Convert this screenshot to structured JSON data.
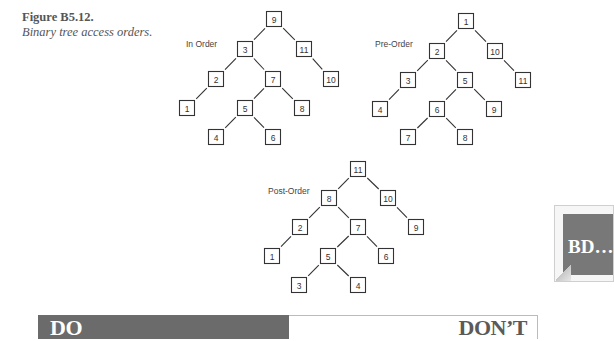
{
  "figure": {
    "number": "Figure B5.12.",
    "caption": "Binary tree access orders."
  },
  "trees": [
    {
      "id": "in-order",
      "label": "In Order",
      "label_pos": [
        186,
        47
      ],
      "nodes": [
        {
          "v": "9",
          "x": 274,
          "y": 19
        },
        {
          "v": "3",
          "x": 245,
          "y": 49
        },
        {
          "v": "11",
          "x": 304,
          "y": 49
        },
        {
          "v": "2",
          "x": 216,
          "y": 79
        },
        {
          "v": "7",
          "x": 273,
          "y": 79
        },
        {
          "v": "10",
          "x": 331,
          "y": 79
        },
        {
          "v": "1",
          "x": 187,
          "y": 108
        },
        {
          "v": "5",
          "x": 245,
          "y": 108
        },
        {
          "v": "8",
          "x": 302,
          "y": 108
        },
        {
          "v": "4",
          "x": 216,
          "y": 137
        },
        {
          "v": "6",
          "x": 273,
          "y": 137
        }
      ],
      "edges": [
        [
          0,
          1
        ],
        [
          0,
          2
        ],
        [
          1,
          3
        ],
        [
          1,
          4
        ],
        [
          2,
          5
        ],
        [
          3,
          6
        ],
        [
          4,
          7
        ],
        [
          4,
          8
        ],
        [
          7,
          9
        ],
        [
          7,
          10
        ]
      ]
    },
    {
      "id": "pre-order",
      "label": "Pre-Order",
      "label_pos": [
        375,
        47
      ],
      "nodes": [
        {
          "v": "1",
          "x": 466,
          "y": 21
        },
        {
          "v": "2",
          "x": 437,
          "y": 51
        },
        {
          "v": "10",
          "x": 495,
          "y": 51
        },
        {
          "v": "3",
          "x": 408,
          "y": 80
        },
        {
          "v": "5",
          "x": 465,
          "y": 80
        },
        {
          "v": "11",
          "x": 523,
          "y": 80
        },
        {
          "v": "4",
          "x": 380,
          "y": 109
        },
        {
          "v": "6",
          "x": 437,
          "y": 109
        },
        {
          "v": "9",
          "x": 494,
          "y": 109
        },
        {
          "v": "7",
          "x": 408,
          "y": 137
        },
        {
          "v": "8",
          "x": 465,
          "y": 137
        }
      ],
      "edges": [
        [
          0,
          1
        ],
        [
          0,
          2
        ],
        [
          1,
          3
        ],
        [
          1,
          4
        ],
        [
          2,
          5
        ],
        [
          3,
          6
        ],
        [
          4,
          7
        ],
        [
          4,
          8
        ],
        [
          7,
          9
        ],
        [
          7,
          10
        ]
      ]
    },
    {
      "id": "post-order",
      "label": "Post-Order",
      "label_pos": [
        268,
        194
      ],
      "nodes": [
        {
          "v": "11",
          "x": 358,
          "y": 169
        },
        {
          "v": "8",
          "x": 329,
          "y": 198
        },
        {
          "v": "10",
          "x": 388,
          "y": 198
        },
        {
          "v": "2",
          "x": 300,
          "y": 227
        },
        {
          "v": "7",
          "x": 358,
          "y": 227
        },
        {
          "v": "9",
          "x": 416,
          "y": 227
        },
        {
          "v": "1",
          "x": 272,
          "y": 256
        },
        {
          "v": "5",
          "x": 328,
          "y": 256
        },
        {
          "v": "6",
          "x": 386,
          "y": 256
        },
        {
          "v": "3",
          "x": 299,
          "y": 285
        },
        {
          "v": "4",
          "x": 358,
          "y": 285
        }
      ],
      "edges": [
        [
          0,
          1
        ],
        [
          0,
          2
        ],
        [
          1,
          3
        ],
        [
          1,
          4
        ],
        [
          2,
          5
        ],
        [
          3,
          6
        ],
        [
          4,
          7
        ],
        [
          4,
          8
        ],
        [
          7,
          9
        ],
        [
          7,
          10
        ]
      ]
    }
  ],
  "badge": {
    "text": "BD…"
  },
  "banner": {
    "do_label": "DO",
    "dont_label": "DON’T"
  },
  "colors": {
    "banner_dark": "#6b6b6b",
    "badge_gray": "#787878",
    "node_stroke": "#333333"
  }
}
